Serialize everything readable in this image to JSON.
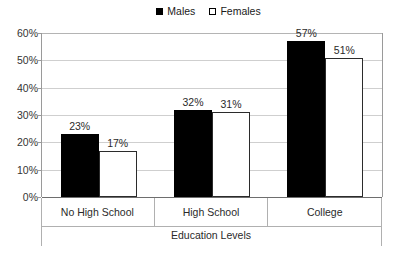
{
  "chart_data": {
    "type": "bar",
    "title": "",
    "subtitle": "",
    "xlabel": "Education Levels",
    "ylabel": "",
    "categories": [
      "No High School",
      "High School",
      "College"
    ],
    "series": [
      {
        "name": "Males",
        "color": "#000000",
        "style": "filled",
        "values": [
          23,
          31.8,
          57
        ]
      },
      {
        "name": "Females",
        "color": "#ffffff",
        "style": "hollow",
        "values": [
          17,
          31,
          51
        ]
      }
    ],
    "data_labels": [
      [
        "23%",
        "17%"
      ],
      [
        "32%",
        "31%"
      ],
      [
        "57%",
        "51%"
      ]
    ],
    "ylim": [
      0,
      60
    ],
    "yticks": [
      0,
      10,
      20,
      30,
      40,
      50,
      60
    ],
    "ytick_labels": [
      "0%",
      "10%",
      "20%",
      "30%",
      "40%",
      "50%",
      "60%"
    ],
    "grid": true,
    "grid_axis": "y",
    "legend_position": "top-center",
    "legend_entries": [
      "Males",
      "Females"
    ]
  },
  "legend": {
    "males": {
      "label": "Males",
      "swatch": "filled-square-icon"
    },
    "females": {
      "label": "Females",
      "swatch": "hollow-square-icon"
    }
  },
  "axes": {
    "x_title": "Education Levels"
  }
}
